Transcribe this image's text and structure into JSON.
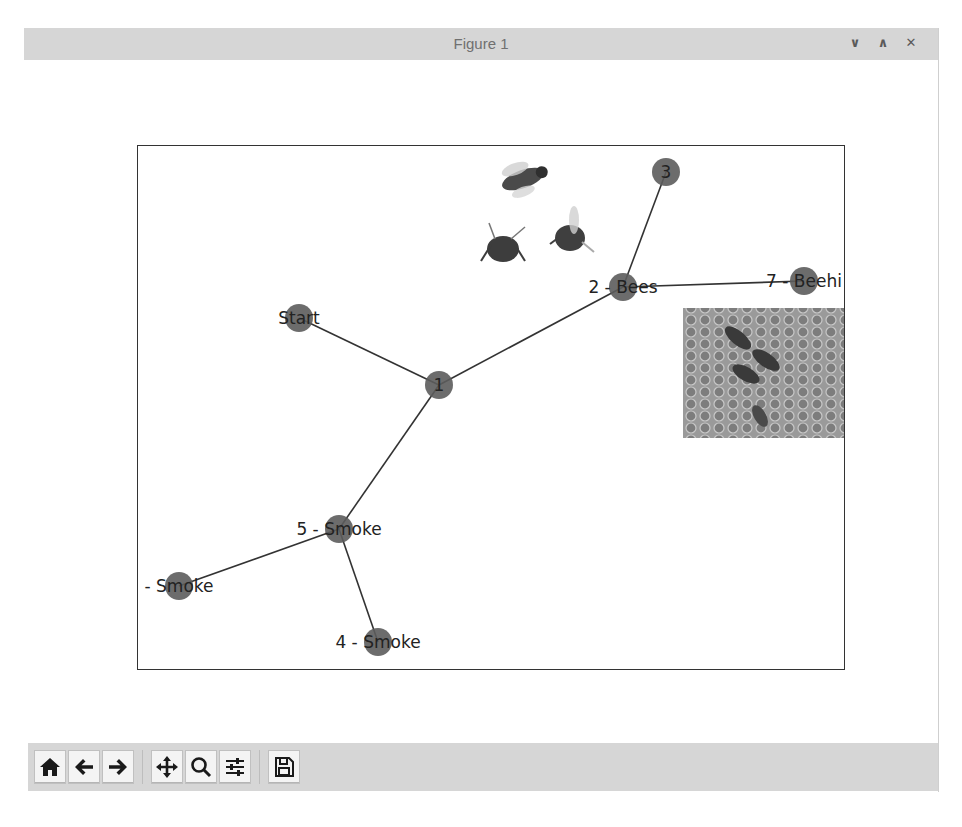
{
  "window": {
    "title": "Figure 1",
    "controls": {
      "minimize_icon": "chevron-down-icon",
      "maximize_icon": "chevron-up-icon",
      "close_icon": "close-icon",
      "minimize_glyph": "∨",
      "maximize_glyph": "∧",
      "close_glyph": "✕"
    }
  },
  "figure": {
    "axes": {
      "frame_color": "#333333",
      "node_color": "#5c5c5c",
      "edge_color": "#333333"
    },
    "nodes": [
      {
        "id": "start",
        "label": "Start",
        "x": 161,
        "y": 172
      },
      {
        "id": "1",
        "label": "1",
        "x": 301,
        "y": 239
      },
      {
        "id": "2",
        "label": "2 - Bees",
        "x": 485,
        "y": 141
      },
      {
        "id": "3",
        "label": "3",
        "x": 528,
        "y": 26
      },
      {
        "id": "7",
        "label": "7 - Beehi",
        "x": 666,
        "y": 135
      },
      {
        "id": "5",
        "label": "5 - Smoke",
        "x": 201,
        "y": 383
      },
      {
        "id": "6",
        "label": "- Smoke",
        "x": 41,
        "y": 440
      },
      {
        "id": "4",
        "label": "4 - Smoke",
        "x": 240,
        "y": 496
      }
    ],
    "edges": [
      [
        "start",
        "1"
      ],
      [
        "1",
        "2"
      ],
      [
        "2",
        "3"
      ],
      [
        "2",
        "7"
      ],
      [
        "1",
        "5"
      ],
      [
        "5",
        "6"
      ],
      [
        "5",
        "4"
      ]
    ],
    "images": [
      {
        "name": "bees-image",
        "description": "three bees",
        "x": 335,
        "y": 7,
        "w": 135,
        "h": 118
      },
      {
        "name": "honeycomb-image",
        "description": "bees on honeycomb",
        "x": 545,
        "y": 162,
        "w": 162,
        "h": 130
      }
    ]
  },
  "toolbar": {
    "buttons": [
      {
        "name": "home-button",
        "icon": "home-icon",
        "tooltip": "Reset original view"
      },
      {
        "name": "back-button",
        "icon": "arrow-left-icon",
        "tooltip": "Back to previous view"
      },
      {
        "name": "forward-button",
        "icon": "arrow-right-icon",
        "tooltip": "Forward to next view"
      },
      {
        "name": "pan-button",
        "icon": "move-icon",
        "tooltip": "Pan axes"
      },
      {
        "name": "zoom-button",
        "icon": "magnifier-icon",
        "tooltip": "Zoom to rectangle"
      },
      {
        "name": "configure-subplots-button",
        "icon": "sliders-icon",
        "tooltip": "Configure subplots"
      },
      {
        "name": "save-button",
        "icon": "floppy-disk-icon",
        "tooltip": "Save the figure"
      }
    ]
  }
}
